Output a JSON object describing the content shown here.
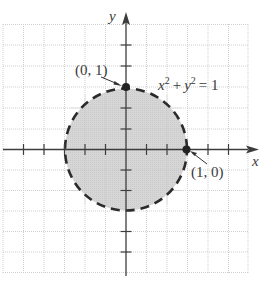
{
  "diagram": {
    "type": "coordinate-plane",
    "axes": {
      "x_label": "x",
      "y_label": "y"
    },
    "region": {
      "description": "Shaded interior of unit circle with dashed boundary",
      "equation_label": "x² + y² = 1",
      "equation": {
        "base1": "x",
        "exp1": "2",
        "plus": "+",
        "base2": "y",
        "exp2": "2",
        "rhs": "= 1"
      },
      "boundary_style": "dashed",
      "fill_color": "#d9d9d9",
      "boundary_color": "#2b2b2b"
    },
    "points": [
      {
        "label": "(0, 1)",
        "x": 0,
        "y": 1
      },
      {
        "label": "(1, 0)",
        "x": 1,
        "y": 0
      }
    ],
    "grid": {
      "visible": true,
      "style": "dotted",
      "color": "#c8c8c8"
    }
  }
}
